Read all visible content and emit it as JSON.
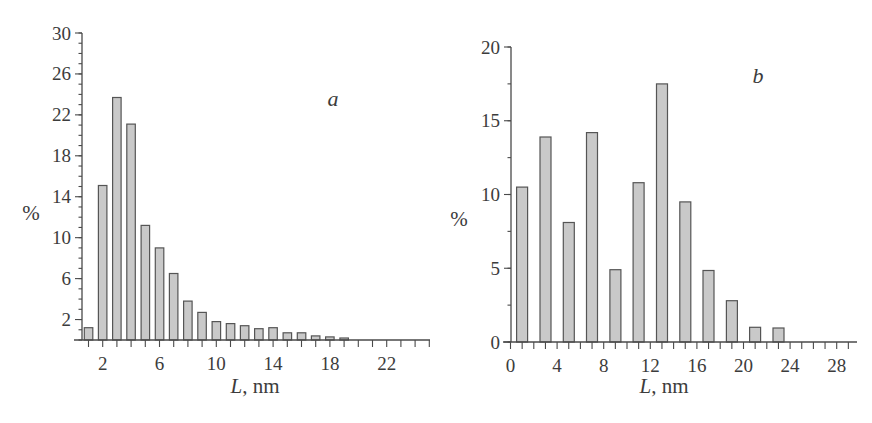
{
  "figure": {
    "panels": [
      "a",
      "b"
    ],
    "bar_fill": "#c9c9c9",
    "bar_stroke": "#555555"
  },
  "chart_data": [
    {
      "type": "bar",
      "panel_label": "a",
      "title": "",
      "xlabel_italic": "L",
      "xlabel_rest": ", nm",
      "xlabel": "L, nm",
      "ylabel": "%",
      "x": [
        1,
        2,
        3,
        4,
        5,
        6,
        7,
        8,
        9,
        10,
        11,
        12,
        13,
        14,
        15,
        16,
        17,
        18,
        19
      ],
      "values": [
        1.2,
        15.1,
        23.7,
        21.1,
        11.2,
        9.0,
        6.5,
        3.8,
        2.7,
        1.8,
        1.6,
        1.4,
        1.1,
        1.2,
        0.7,
        0.7,
        0.4,
        0.3,
        0.2
      ],
      "xticks": [
        2,
        6,
        10,
        14,
        18,
        22
      ],
      "xtick_labels": [
        "2",
        "6",
        "10",
        "14",
        "18",
        "22"
      ],
      "yticks": [
        2,
        6,
        10,
        14,
        18,
        22,
        26,
        30
      ],
      "ytick_labels": [
        "2",
        "6",
        "10",
        "14",
        "18",
        "22",
        "26",
        "30"
      ],
      "xlim": [
        0.3,
        25
      ],
      "ylim": [
        0,
        30
      ],
      "grid": false,
      "legend": null
    },
    {
      "type": "bar",
      "panel_label": "b",
      "title": "",
      "xlabel_italic": "L",
      "xlabel_rest": ", nm",
      "xlabel": "L, nm",
      "ylabel": "%",
      "x": [
        1,
        3,
        5,
        7,
        9,
        11,
        13,
        15,
        17,
        19,
        21,
        23
      ],
      "values": [
        10.5,
        13.9,
        8.1,
        14.2,
        4.9,
        10.8,
        17.5,
        9.5,
        4.85,
        2.8,
        1.0,
        0.95
      ],
      "xticks": [
        0,
        4,
        8,
        12,
        16,
        20,
        24,
        28
      ],
      "xtick_labels": [
        "0",
        "4",
        "8",
        "12",
        "16",
        "20",
        "24",
        "28"
      ],
      "yticks": [
        0,
        5,
        10,
        15,
        20
      ],
      "ytick_labels": [
        "0",
        "5",
        "10",
        "15",
        "20"
      ],
      "xlim": [
        0,
        29.5
      ],
      "ylim": [
        0,
        20
      ],
      "grid": false,
      "legend": null
    }
  ]
}
